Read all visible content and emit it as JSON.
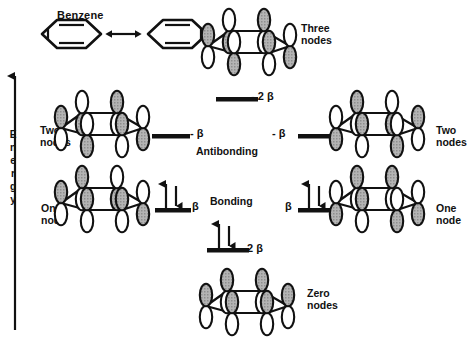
{
  "figure": {
    "title": "Benzene",
    "energy_axis_label": "Energy",
    "section_labels": {
      "antibonding": "Antibonding",
      "bonding": "Bonding"
    }
  },
  "molecular_orbitals": [
    {
      "id": "mo-three-nodes",
      "node_label_line1": "Three",
      "node_label_line2": "nodes",
      "energy_label": "- 2 β",
      "occupancy": "empty",
      "position": "top-center",
      "ring_x": 250,
      "ring_y": 40,
      "level_x": 216,
      "level_y": 97,
      "phases": [
        1,
        0,
        1,
        0,
        1,
        0
      ]
    },
    {
      "id": "mo-two-nodes-left",
      "node_label_line1": "Two",
      "node_label_line2": "nodes",
      "energy_label": "- β",
      "occupancy": "empty",
      "position": "mid-left",
      "ring_x": 103,
      "ring_y": 122,
      "level_x": 152,
      "level_y": 134,
      "phases": [
        1,
        0,
        1,
        0,
        1,
        0
      ]
    },
    {
      "id": "mo-two-nodes-right",
      "node_label_line1": "Two",
      "node_label_line2": "nodes",
      "energy_label": "- β",
      "occupancy": "empty",
      "position": "mid-right",
      "ring_x": 378,
      "ring_y": 122,
      "level_x": 298,
      "level_y": 134,
      "phases": [
        0,
        1,
        0,
        1,
        0,
        1
      ]
    },
    {
      "id": "mo-one-node-left",
      "node_label_line1": "One",
      "node_label_line2": "node",
      "energy_label": "β",
      "occupancy": "paired",
      "position": "low-left",
      "ring_x": 103,
      "ring_y": 197,
      "level_x": 155,
      "level_y": 208,
      "phases": [
        1,
        1,
        0,
        0,
        1,
        1
      ]
    },
    {
      "id": "mo-one-node-right",
      "node_label_line1": "One",
      "node_label_line2": "node",
      "energy_label": "β",
      "occupancy": "paired",
      "position": "low-right",
      "ring_x": 378,
      "ring_y": 197,
      "level_x": 298,
      "level_y": 208,
      "phases": [
        0,
        1,
        1,
        0,
        0,
        1
      ]
    },
    {
      "id": "mo-zero-nodes",
      "node_label_line1": "Zero",
      "node_label_line2": "nodes",
      "energy_label": "2 β",
      "occupancy": "paired",
      "position": "bottom-center",
      "ring_x": 248,
      "ring_y": 300,
      "level_x": 207,
      "level_y": 248,
      "phases": [
        1,
        1,
        1,
        1,
        1,
        1
      ]
    }
  ],
  "resonance": {
    "structure_left": "benzene-kekule-structure",
    "structure_right": "benzene-kekule-structure",
    "arrow": "double-headed-resonance-arrow"
  },
  "colors": {
    "stroke": "#111111",
    "lobe_shaded": "#a8a8a8",
    "lobe_empty": "#ffffff",
    "background": "#ffffff"
  }
}
